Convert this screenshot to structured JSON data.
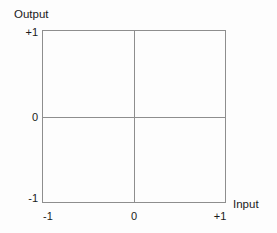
{
  "figure": {
    "background_color": "#fdfdfd",
    "line_color": "#8e8e8e",
    "text_color": "#1a1a1a"
  },
  "chart_data": {
    "type": "scatter",
    "title": "",
    "xlabel": "Input",
    "ylabel": "Output",
    "xlim": [
      -1,
      1
    ],
    "ylim": [
      -1,
      1
    ],
    "xticks": [
      "-1",
      "0",
      "+1"
    ],
    "yticks": [
      "-1",
      "0",
      "+1"
    ],
    "xtick_values": [
      -1,
      0,
      1
    ],
    "ytick_values": [
      -1,
      0,
      1
    ],
    "grid": false,
    "legend": null,
    "series": [],
    "annotations": []
  },
  "axes": {
    "y_title": "Output",
    "x_title": "Input",
    "y_ticks": {
      "top": "+1",
      "middle": "0",
      "bottom": "-1"
    },
    "x_ticks": {
      "left": "-1",
      "middle": "0",
      "right": "+1"
    }
  }
}
